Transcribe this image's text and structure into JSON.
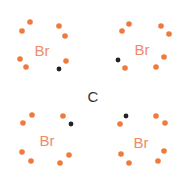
{
  "diagram": {
    "colors": {
      "bromine_text": "#f08a6a",
      "bromine_electron": "#f07a3e",
      "carbon_electron": "#222222",
      "carbon_text": "#333333"
    },
    "center_atom": {
      "symbol": "C",
      "x": 93,
      "y": 96
    },
    "atoms": [
      {
        "symbol": "Br",
        "x": 42,
        "y": 50,
        "lone_pair_dots": [
          [
            30,
            22
          ],
          [
            22,
            31
          ],
          [
            59,
            26
          ],
          [
            65,
            36
          ],
          [
            20,
            59
          ],
          [
            26,
            67
          ],
          [
            66,
            61
          ]
        ],
        "carbon_dot": [
          59,
          69
        ]
      },
      {
        "symbol": "Br",
        "x": 142,
        "y": 49,
        "lone_pair_dots": [
          [
            129,
            24
          ],
          [
            122,
            31
          ],
          [
            161,
            26
          ],
          [
            169,
            34
          ],
          [
            164,
            57
          ],
          [
            156,
            67
          ],
          [
            125,
            68
          ]
        ],
        "carbon_dot": [
          118,
          60
        ]
      },
      {
        "symbol": "Br",
        "x": 47,
        "y": 140,
        "lone_pair_dots": [
          [
            32,
            115
          ],
          [
            23,
            123
          ],
          [
            63,
            116
          ],
          [
            22,
            152
          ],
          [
            31,
            161
          ],
          [
            69,
            155
          ],
          [
            60,
            163
          ]
        ],
        "carbon_dot": [
          71,
          124
        ]
      },
      {
        "symbol": "Br",
        "x": 141,
        "y": 142,
        "lone_pair_dots": [
          [
            120,
            124
          ],
          [
            156,
            116
          ],
          [
            165,
            123
          ],
          [
            121,
            154
          ],
          [
            129,
            163
          ],
          [
            164,
            151
          ],
          [
            158,
            161
          ]
        ],
        "carbon_dot": [
          126,
          116
        ]
      }
    ]
  }
}
